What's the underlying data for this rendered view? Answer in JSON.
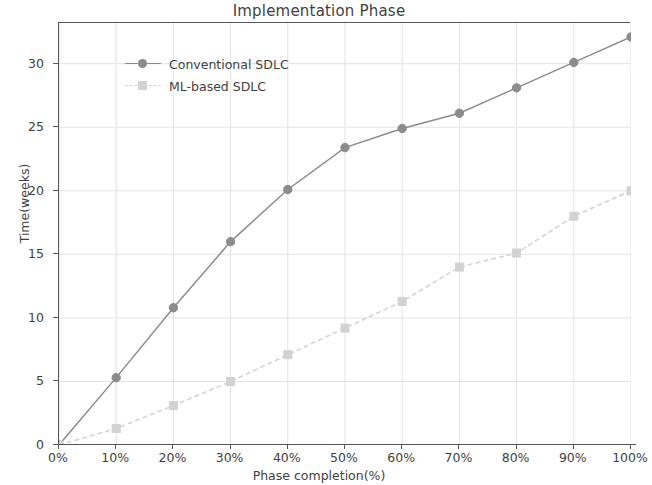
{
  "chart_data": {
    "type": "line",
    "title": "Implementation Phase",
    "xlabel": "Phase completion(%)",
    "ylabel": "Time(weeks)",
    "x": [
      0,
      10,
      20,
      30,
      40,
      50,
      60,
      70,
      80,
      90,
      100
    ],
    "x_tick_labels": [
      "0%",
      "10%",
      "20%",
      "30%",
      "40%",
      "50%",
      "60%",
      "70%",
      "80%",
      "90%",
      "100%"
    ],
    "y_tick_labels": [
      "0",
      "5",
      "10",
      "15",
      "20",
      "25",
      "30"
    ],
    "y_ticks": [
      0,
      5,
      10,
      15,
      20,
      25,
      30
    ],
    "xlim": [
      0,
      100
    ],
    "ylim": [
      0,
      33.2
    ],
    "grid": true,
    "legend_position": "upper left",
    "series": [
      {
        "name": "Conventional SDLC",
        "values": [
          0,
          5.3,
          10.8,
          16.0,
          20.1,
          23.4,
          24.9,
          26.1,
          28.1,
          30.1,
          32.1
        ],
        "color": "#8c8c8c",
        "marker": "circle",
        "linestyle": "solid"
      },
      {
        "name": "ML-based SDLC",
        "values": [
          0,
          1.3,
          3.1,
          5.0,
          7.1,
          9.2,
          11.3,
          14.0,
          15.1,
          18.0,
          20.0
        ],
        "color": "#d2d2d2",
        "marker": "square",
        "linestyle": "dashed"
      }
    ]
  },
  "style": {
    "axis_color": "#555555",
    "grid_color": "#e3e3e3",
    "text_color": "#3f3f3f",
    "background": "#ffffff"
  }
}
